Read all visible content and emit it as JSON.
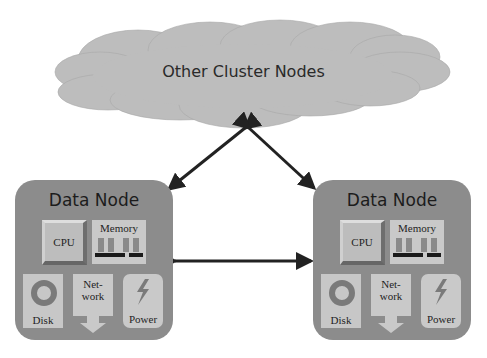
{
  "cloud": {
    "label": "Other Cluster Nodes",
    "fill": "#bdbdbd"
  },
  "nodes": [
    {
      "title": "Data Node",
      "components": {
        "cpu": "CPU",
        "memory": "Memory",
        "disk": "Disk",
        "network_line1": "Net-",
        "network_line2": "work",
        "power": "Power"
      }
    },
    {
      "title": "Data Node",
      "components": {
        "cpu": "CPU",
        "memory": "Memory",
        "disk": "Disk",
        "network_line1": "Net-",
        "network_line2": "work",
        "power": "Power"
      }
    }
  ],
  "connections": [
    {
      "from": "cloud",
      "to": "node-left",
      "type": "bidirectional"
    },
    {
      "from": "cloud",
      "to": "node-right",
      "type": "bidirectional"
    },
    {
      "from": "node-left",
      "to": "node-right",
      "type": "bidirectional"
    }
  ],
  "colors": {
    "node": "#8c8c8c",
    "component": "#c8c8c8",
    "arrow": "#222222"
  }
}
